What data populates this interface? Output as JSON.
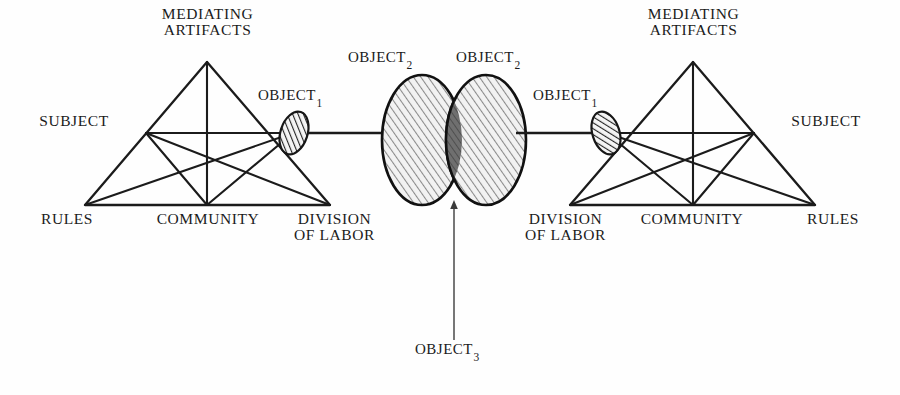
{
  "diagram": {
    "type": "activity-theory-triangles",
    "background_color": "#fefefe",
    "stroke_color": "#1b1b1b",
    "hatch_fill_color": "#e8e8e8",
    "overlap_fill_color": "#6a6a6a",
    "text_color": "#1b1b1b"
  },
  "left_system": {
    "mediating_artifacts": "MEDIATING\nARTIFACTS",
    "subject": "SUBJECT",
    "rules": "RULES",
    "community": "COMMUNITY",
    "division_of_labor": "DIVISION\nOF LABOR",
    "object_label": "OBJECT",
    "object_subscript": "1"
  },
  "right_system": {
    "mediating_artifacts": "MEDIATING\nARTIFACTS",
    "subject": "SUBJECT",
    "rules": "RULES",
    "community": "COMMUNITY",
    "division_of_labor": "DIVISION\nOF LABOR",
    "object_label": "OBJECT",
    "object_subscript": "1"
  },
  "shared_objects": {
    "left_object2_label": "OBJECT",
    "left_object2_subscript": "2",
    "right_object2_label": "OBJECT",
    "right_object2_subscript": "2",
    "object3_label": "OBJECT",
    "object3_subscript": "3"
  }
}
